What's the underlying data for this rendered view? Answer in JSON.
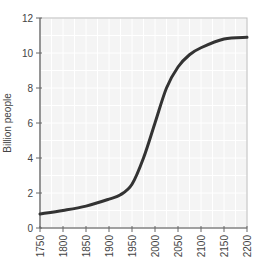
{
  "chart_data": {
    "type": "line",
    "title": "",
    "xlabel": "",
    "ylabel": "Billion people",
    "xlim": [
      1750,
      2200
    ],
    "ylim": [
      0,
      12
    ],
    "grid": true,
    "legend": null,
    "x_ticks": [
      1750,
      1800,
      1850,
      1900,
      1950,
      2000,
      2050,
      2100,
      2150,
      2200
    ],
    "y_ticks": [
      0,
      2,
      4,
      6,
      8,
      10,
      12
    ],
    "series": [
      {
        "name": "World population",
        "color": "#333333",
        "x": [
          1750,
          1800,
          1850,
          1900,
          1925,
          1950,
          1975,
          2000,
          2025,
          2050,
          2075,
          2100,
          2150,
          2200
        ],
        "values": [
          0.8,
          1.0,
          1.25,
          1.65,
          1.9,
          2.5,
          4.0,
          6.0,
          8.0,
          9.2,
          9.9,
          10.3,
          10.8,
          10.9
        ]
      }
    ]
  },
  "colors": {
    "plot_bg": "#f4f4f4",
    "grid": "#ffffff",
    "axis": "#666666",
    "line": "#333333"
  }
}
